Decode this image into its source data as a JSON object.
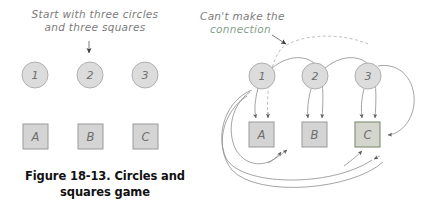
{
  "figure": {
    "caption_line1": "Figure 18-13. Circles and",
    "caption_line2": "squares game"
  },
  "left_panel": {
    "annotation_line1": "Start with three circles",
    "annotation_line2": "and three squares",
    "circles": [
      {
        "label": "1",
        "cx": 35,
        "cy": 75
      },
      {
        "label": "2",
        "cx": 90,
        "cy": 75
      },
      {
        "label": "3",
        "cx": 145,
        "cy": 75
      }
    ],
    "squares": [
      {
        "label": "A",
        "x": 23,
        "y": 124
      },
      {
        "label": "B",
        "x": 78,
        "y": 124
      },
      {
        "label": "C",
        "x": 133,
        "y": 124
      }
    ]
  },
  "right_panel": {
    "annotation_line1": "Can't make the",
    "annotation_line2": "connection",
    "circles": [
      {
        "label": "1",
        "cx": 262,
        "cy": 76
      },
      {
        "label": "2",
        "cx": 315,
        "cy": 76
      },
      {
        "label": "3",
        "cx": 368,
        "cy": 76
      }
    ],
    "squares": [
      {
        "label": "A",
        "x": 249,
        "y": 122
      },
      {
        "label": "B",
        "x": 302,
        "y": 122
      },
      {
        "label": "C",
        "x": 355,
        "y": 122
      }
    ],
    "blocked_connection": "3-to-A"
  },
  "colors": {
    "node_fill": "#dcdcdc",
    "node_stroke": "#a9a9a9",
    "square_fill": "#d4d4d4",
    "square_stroke": "#9a9a9a",
    "highlight_stroke": "#7e8c72",
    "annotation_gray": "#7b7b7b",
    "annotation_green": "#86a08c",
    "edge_stroke": "#8d8d8d",
    "caption": "#111111"
  }
}
